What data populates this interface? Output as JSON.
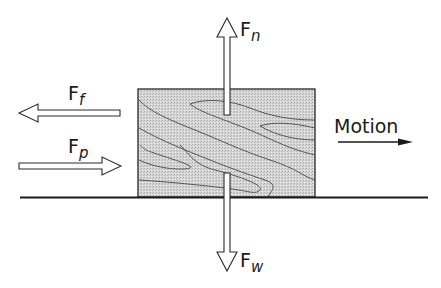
{
  "diagram": {
    "colors": {
      "background": "#ffffff",
      "block_fill": "#d4d4d4",
      "stroke": "#2a2a2a",
      "grain": "#555555",
      "arrow_fill": "#ffffff"
    },
    "forces": [
      {
        "id": "normal",
        "symbol": "F",
        "subscript": "n",
        "direction": "up"
      },
      {
        "id": "friction",
        "symbol": "F",
        "subscript": "f",
        "direction": "left"
      },
      {
        "id": "push",
        "symbol": "F",
        "subscript": "p",
        "direction": "right"
      },
      {
        "id": "weight",
        "symbol": "F",
        "subscript": "w",
        "direction": "down"
      }
    ],
    "motion": {
      "label": "Motion",
      "direction": "right"
    },
    "block": {
      "material": "wood"
    },
    "surface": {
      "type": "ground-line"
    }
  }
}
